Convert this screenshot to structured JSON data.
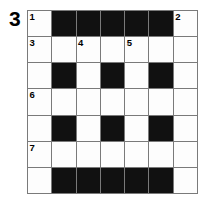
{
  "puzzle": {
    "label": "3",
    "rows": 7,
    "columns": 7,
    "colors": {
      "block": "#111111",
      "open": "#fdfdfd",
      "border": "#7a7a7a",
      "number": "#000000",
      "background": "#ffffff"
    },
    "grid": [
      [
        {
          "type": "open",
          "number": "1"
        },
        {
          "type": "block",
          "number": ""
        },
        {
          "type": "block",
          "number": ""
        },
        {
          "type": "block",
          "number": ""
        },
        {
          "type": "block",
          "number": ""
        },
        {
          "type": "block",
          "number": ""
        },
        {
          "type": "open",
          "number": "2"
        }
      ],
      [
        {
          "type": "open",
          "number": "3"
        },
        {
          "type": "open",
          "number": ""
        },
        {
          "type": "open",
          "number": "4"
        },
        {
          "type": "open",
          "number": ""
        },
        {
          "type": "open",
          "number": "5"
        },
        {
          "type": "open",
          "number": ""
        },
        {
          "type": "open",
          "number": ""
        }
      ],
      [
        {
          "type": "open",
          "number": ""
        },
        {
          "type": "block",
          "number": ""
        },
        {
          "type": "open",
          "number": ""
        },
        {
          "type": "block",
          "number": ""
        },
        {
          "type": "open",
          "number": ""
        },
        {
          "type": "block",
          "number": ""
        },
        {
          "type": "open",
          "number": ""
        }
      ],
      [
        {
          "type": "open",
          "number": "6"
        },
        {
          "type": "open",
          "number": ""
        },
        {
          "type": "open",
          "number": ""
        },
        {
          "type": "open",
          "number": ""
        },
        {
          "type": "open",
          "number": ""
        },
        {
          "type": "open",
          "number": ""
        },
        {
          "type": "open",
          "number": ""
        }
      ],
      [
        {
          "type": "open",
          "number": ""
        },
        {
          "type": "block",
          "number": ""
        },
        {
          "type": "open",
          "number": ""
        },
        {
          "type": "block",
          "number": ""
        },
        {
          "type": "open",
          "number": ""
        },
        {
          "type": "block",
          "number": ""
        },
        {
          "type": "open",
          "number": ""
        }
      ],
      [
        {
          "type": "open",
          "number": "7"
        },
        {
          "type": "open",
          "number": ""
        },
        {
          "type": "open",
          "number": ""
        },
        {
          "type": "open",
          "number": ""
        },
        {
          "type": "open",
          "number": ""
        },
        {
          "type": "open",
          "number": ""
        },
        {
          "type": "open",
          "number": ""
        }
      ],
      [
        {
          "type": "open",
          "number": ""
        },
        {
          "type": "block",
          "number": ""
        },
        {
          "type": "block",
          "number": ""
        },
        {
          "type": "block",
          "number": ""
        },
        {
          "type": "block",
          "number": ""
        },
        {
          "type": "block",
          "number": ""
        },
        {
          "type": "open",
          "number": ""
        }
      ]
    ]
  }
}
